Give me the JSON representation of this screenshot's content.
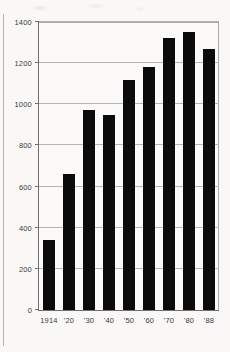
{
  "chart_data": {
    "type": "bar",
    "title": "",
    "subtitle": "",
    "xlabel": "",
    "ylabel": "",
    "categories": [
      "1914",
      "'20",
      "'30",
      "'40",
      "'50",
      "'60",
      "'70",
      "'80",
      "'88"
    ],
    "values": [
      340,
      660,
      970,
      950,
      1120,
      1180,
      1320,
      1350,
      1270
    ],
    "series": [
      {
        "name": "",
        "values": [
          340,
          660,
          970,
          950,
          1120,
          1180,
          1320,
          1350,
          1270
        ]
      }
    ],
    "ylim": [
      0,
      1400
    ],
    "yticks": [
      0,
      200,
      400,
      600,
      800,
      1000,
      1200,
      1400
    ],
    "ytick_labels": [
      "0",
      "200",
      "400",
      "600",
      "800",
      "1000",
      "1200",
      "1400"
    ],
    "xtick_labels": [
      "1914",
      "'20",
      "'30",
      "'40",
      "'50",
      "'60",
      "'70",
      "'80",
      "'88"
    ],
    "grid": true,
    "grid_axis": "y",
    "legend": false,
    "legend_position": "none",
    "bar_color": "#0b0b0b",
    "grid_color": "#b4b4b4",
    "axis_color": "#6e6e6e",
    "background_color": "#f9f8f6",
    "annotations": []
  }
}
